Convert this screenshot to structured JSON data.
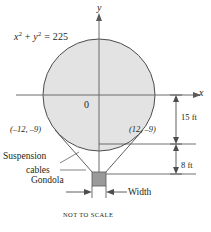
{
  "figure": {
    "caption": "NOT TO SCALE",
    "equation": {
      "text": "x2 + y2 = 225",
      "lhs_x": "x",
      "lhs_x_exp": "2",
      "plus": "+",
      "lhs_y": "y",
      "lhs_y_exp": "2",
      "equals": "=",
      "rhs": "225"
    },
    "axes": {
      "x_label": "x",
      "y_label": "y",
      "origin_label": "0"
    },
    "points": [
      {
        "name": "left-tangent-point",
        "label": "(–12, –9)",
        "x": -12,
        "y": -9
      },
      {
        "name": "right-tangent-point",
        "label": "(12, –9)",
        "x": 12,
        "y": -9
      }
    ],
    "dimensions": [
      {
        "name": "balloon-drop",
        "label": "15 ft",
        "value": 15,
        "unit": "ft"
      },
      {
        "name": "cable-drop",
        "label": "8 ft",
        "value": 8,
        "unit": "ft"
      }
    ],
    "callouts": {
      "suspension_line1": "Suspension",
      "suspension_line2": "cables",
      "gondola": "Gondola",
      "width": "Width"
    },
    "colors": {
      "balloon_fill": "#e3e3e3",
      "balloon_stroke": "#4d4d4d",
      "gondola_fill": "#9a9a9a",
      "gondola_stroke": "#5a5a5a",
      "axis": "#5a5a5a",
      "text": "#231f20"
    },
    "geometry": {
      "circle_center_x": 99,
      "circle_center_y": 95,
      "circle_radius": 56,
      "x_axis_y": 95,
      "gondola_left": 92,
      "gondola_top": 172,
      "gondola_size": 14
    }
  }
}
